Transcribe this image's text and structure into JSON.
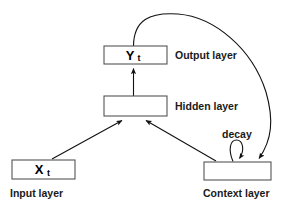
{
  "diagram": {
    "background_color": "#ffffff",
    "line_color": "#111111",
    "box_stroke_color": "#555555",
    "box_fill_color": "#ffffff",
    "nodes": [
      {
        "id": "output",
        "box_label_main": "Y",
        "box_label_sub": "t",
        "side_label": "Output layer",
        "x": 104,
        "y": 46,
        "w": 63,
        "h": 18
      },
      {
        "id": "hidden",
        "box_label_main": "",
        "box_label_sub": "",
        "side_label": "Hidden layer",
        "x": 104,
        "y": 96,
        "w": 63,
        "h": 20
      },
      {
        "id": "input",
        "box_label_main": "X",
        "box_label_sub": "t",
        "side_label": "Input layer",
        "x": 12,
        "y": 160,
        "w": 63,
        "h": 19
      },
      {
        "id": "context",
        "box_label_main": "",
        "box_label_sub": "",
        "side_label": "Context layer",
        "x": 204,
        "y": 162,
        "w": 67,
        "h": 18
      }
    ],
    "labels": {
      "output_layer": "Output layer",
      "hidden_layer": "Hidden layer",
      "input_layer": "Input layer",
      "context_layer": "Context layer",
      "decay": "decay",
      "output_symbol": "Y",
      "output_subscript": "t",
      "input_symbol": "X",
      "input_subscript": "t"
    },
    "edges": [
      {
        "id": "hidden-to-output",
        "from": "hidden",
        "to": "output",
        "kind": "straight-arrow"
      },
      {
        "id": "input-to-hidden",
        "from": "input",
        "to": "hidden",
        "kind": "straight-arrow"
      },
      {
        "id": "context-to-hidden",
        "from": "context",
        "to": "hidden",
        "kind": "straight-arrow"
      },
      {
        "id": "output-to-context",
        "from": "output",
        "to": "context",
        "kind": "curved-arrow"
      },
      {
        "id": "context-self-loop",
        "from": "context",
        "to": "context",
        "kind": "self-loop",
        "annotation": "decay"
      }
    ]
  }
}
